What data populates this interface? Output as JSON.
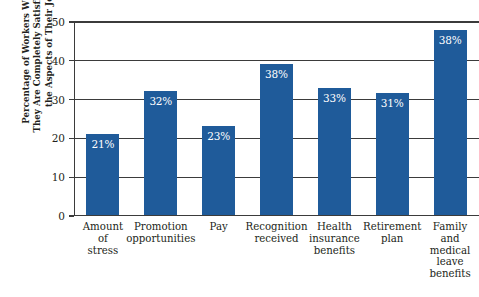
{
  "chart_data": {
    "type": "bar",
    "title": "",
    "xlabel": "",
    "ylabel": "Percentage of Workers Who Say They Are Completely Satisfied With the Aspects of Their Jobs",
    "ylabel_lines": [
      "Percentage of Workers Who Say",
      "They Are Completely Satisfied With",
      "the Aspects of Their Jobs"
    ],
    "ylim": [
      0,
      50
    ],
    "yticks": [
      0,
      10,
      20,
      30,
      40,
      50
    ],
    "ytick_labels": [
      "0",
      "10",
      "20",
      "30",
      "40",
      "50"
    ],
    "grid": true,
    "legend": "none",
    "bar_color": "#1f5b9a",
    "categories": [
      "Amount of stress",
      "Promotion opportunities",
      "Pay",
      "Recognition received",
      "Health insurance benefits",
      "Retirement plan",
      "Family and medical leave benefits"
    ],
    "category_lines": [
      [
        "Amount",
        "of",
        "stress"
      ],
      [
        "Promotion",
        "opportunities"
      ],
      [
        "Pay"
      ],
      [
        "Recognition",
        "received"
      ],
      [
        "Health",
        "insurance",
        "benefits"
      ],
      [
        "Retirement",
        "plan"
      ],
      [
        "Family",
        "and",
        "medical",
        "leave",
        "benefits"
      ]
    ],
    "values": [
      21,
      32,
      23,
      38,
      33,
      31,
      38
    ],
    "bar_tops": [
      21,
      32,
      23,
      39,
      33,
      31.5,
      48
    ],
    "data_labels": [
      "21%",
      "32%",
      "23%",
      "38%",
      "33%",
      "31%",
      "38%"
    ]
  }
}
